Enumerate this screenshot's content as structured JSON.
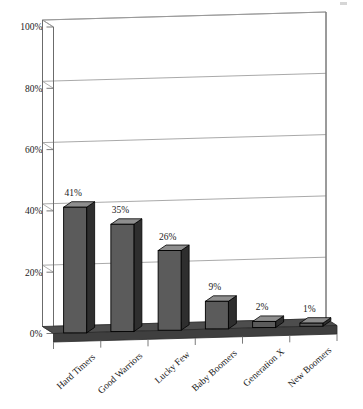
{
  "chart_data": {
    "type": "bar",
    "title": "",
    "subtitle": "",
    "xlabel": "",
    "ylabel": "",
    "categories": [
      "Hard Timers",
      "Good Warriors",
      "Lucky Few",
      "Baby Boomers",
      "Generation X",
      "New Boomers"
    ],
    "values": [
      41,
      35,
      26,
      9,
      2,
      1
    ],
    "data_labels": [
      "41%",
      "35%",
      "26%",
      "9%",
      "2%",
      "1%"
    ],
    "ylim": [
      0,
      100
    ],
    "yticks": [
      0,
      20,
      40,
      60,
      80,
      100
    ],
    "ytick_labels": [
      "0%",
      "20%",
      "40%",
      "60%",
      "80%",
      "100%"
    ],
    "grid": true,
    "legend": false,
    "legend_position": "none",
    "style": "3d-perspective",
    "series": [
      {
        "name": "",
        "values": [
          41,
          35,
          26,
          9,
          2,
          1
        ]
      }
    ]
  },
  "colors": {
    "background": "#ffffff",
    "bar_front": "#5b5b5b",
    "bar_side": "#2e2e2e",
    "bar_top": "#8e8e8e",
    "bar_outline": "#000000",
    "floor": "#4d4d4d",
    "floor_edge": "#2a2a2a",
    "gridline": "#9a9a9a",
    "axis": "#6b6b6b",
    "wall": "#ffffff",
    "text": "#1a1a1a"
  }
}
